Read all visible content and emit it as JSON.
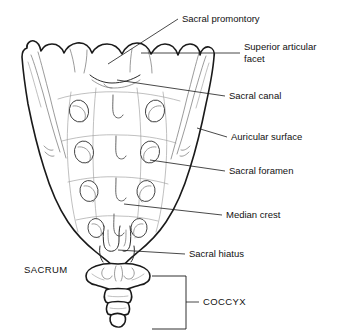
{
  "figure": {
    "background_color": "#ffffff",
    "line_color": "#1a1a1a",
    "width": 337,
    "height": 333
  },
  "labels": {
    "sacral_promontory": "Sacral promontory",
    "superior_articular_facet_line1": "Superior articular",
    "superior_articular_facet_line2": "facet",
    "sacral_canal": "Sacral canal",
    "auricular_surface": "Auricular surface",
    "sacral_foramen": "Sacral foramen",
    "median_crest": "Median crest",
    "sacral_hiatus": "Sacral hiatus",
    "sacrum": "SACRUM",
    "coccyx": "COCCYX"
  },
  "structures": [
    {
      "name": "sacral-promontory",
      "label": "Sacral promontory",
      "side": "right",
      "leader": "diagonal"
    },
    {
      "name": "superior-articular-facet",
      "label": "Superior articular facet",
      "side": "right",
      "leader": "horizontal"
    },
    {
      "name": "sacral-canal",
      "label": "Sacral canal",
      "side": "right",
      "leader": "horizontal"
    },
    {
      "name": "auricular-surface",
      "label": "Auricular surface",
      "side": "right",
      "leader": "horizontal"
    },
    {
      "name": "sacral-foramen",
      "label": "Sacral foramen",
      "side": "right",
      "leader": "horizontal"
    },
    {
      "name": "median-crest",
      "label": "Median crest",
      "side": "right",
      "leader": "horizontal"
    },
    {
      "name": "sacral-hiatus",
      "label": "Sacral hiatus",
      "side": "right",
      "leader": "horizontal"
    },
    {
      "name": "sacrum",
      "label": "SACRUM",
      "side": "left",
      "leader": "none"
    },
    {
      "name": "coccyx",
      "label": "COCCYX",
      "side": "right",
      "leader": "bracket"
    }
  ],
  "anatomy": {
    "foramina_pairs": 4,
    "coccyx_segments": 4,
    "superior_bumps": 4
  }
}
